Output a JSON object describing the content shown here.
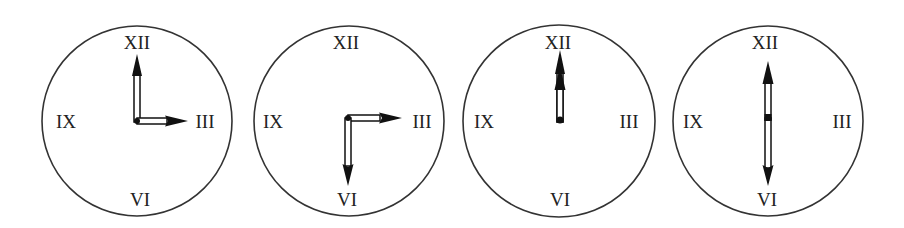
{
  "numerals": {
    "top": "XII",
    "right": "III",
    "bottom": "VI",
    "left": "IX"
  },
  "colors": {
    "line": "#333333",
    "hand": "#111111",
    "background": "#ffffff"
  },
  "clocks": [
    {
      "id": "clock-1",
      "time": "3:00",
      "hour_hand_angle": 90,
      "minute_hand_angle": 0
    },
    {
      "id": "clock-2",
      "time": "3:30",
      "hour_hand_angle": 90,
      "minute_hand_angle": 180
    },
    {
      "id": "clock-3",
      "time": "12:00",
      "hour_hand_angle": 0,
      "minute_hand_angle": 0
    },
    {
      "id": "clock-4",
      "time": "6:00",
      "hour_hand_angle": 180,
      "minute_hand_angle": 0
    }
  ]
}
